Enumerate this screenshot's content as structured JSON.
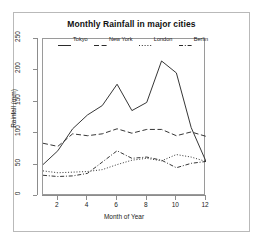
{
  "figure": {
    "title": "Monthly Rainfall in major cities"
  },
  "axes": {
    "x_title": "Month of Year",
    "y_title": "Rainfall (mm)",
    "x_ticks": [
      "2",
      "4",
      "6",
      "8",
      "10",
      "12"
    ],
    "y_ticks": [
      "0",
      "50",
      "100",
      "150",
      "200",
      "250"
    ]
  },
  "legend": {
    "items": [
      {
        "label": "Tokyo",
        "dash": "solid"
      },
      {
        "label": "New York",
        "dash": "dashed"
      },
      {
        "label": "London",
        "dash": "dotted"
      },
      {
        "label": "Berlin",
        "dash": "dashdot"
      }
    ]
  },
  "colors": {
    "line": "#2b2b2b",
    "axis": "#8c8c8c",
    "panel_border": "#9a9a9a",
    "figure_border": "#b9b9b9",
    "background": "#ffffff"
  },
  "chart_data": {
    "type": "line",
    "title": "Monthly Rainfall in major cities",
    "xlabel": "Month of Year",
    "ylabel": "Rainfall (mm)",
    "x": [
      1,
      2,
      3,
      4,
      5,
      6,
      7,
      8,
      9,
      10,
      11,
      12
    ],
    "xlim": [
      1,
      12
    ],
    "ylim": [
      0,
      250
    ],
    "grid": false,
    "legend_position": "top-inside",
    "series": [
      {
        "name": "Tokyo",
        "dash": "solid",
        "values": [
          50,
          72,
          107,
          129,
          144,
          178,
          136,
          149,
          215,
          196,
          109,
          55
        ]
      },
      {
        "name": "New York",
        "dash": "dashed",
        "values": [
          84,
          79,
          99,
          96,
          99,
          107,
          100,
          106,
          106,
          96,
          102,
          95
        ]
      },
      {
        "name": "London",
        "dash": "dotted",
        "values": [
          40,
          37,
          38,
          39,
          42,
          50,
          57,
          60,
          56,
          66,
          62,
          55
        ]
      },
      {
        "name": "Berlin",
        "dash": "dashdot",
        "values": [
          33,
          31,
          32,
          36,
          54,
          72,
          60,
          62,
          57,
          45,
          52,
          55
        ]
      }
    ]
  }
}
